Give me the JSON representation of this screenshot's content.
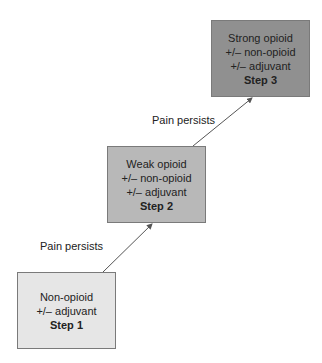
{
  "diagram": {
    "steps": [
      {
        "lines": [
          "Non-opioid",
          "+/– adjuvant"
        ],
        "step": "Step 1",
        "fill": "#e6e6e6"
      },
      {
        "lines": [
          "Weak opioid",
          "+/– non-opioid",
          "+/– adjuvant"
        ],
        "step": "Step 2",
        "fill": "#b8b8b8"
      },
      {
        "lines": [
          "Strong opioid",
          "+/– non-opioid",
          "+/– adjuvant"
        ],
        "step": "Step 3",
        "fill": "#909090"
      }
    ],
    "arrows": [
      {
        "label": "Pain persists",
        "from": "Step 1",
        "to": "Step 2"
      },
      {
        "label": "Pain persists",
        "from": "Step 2",
        "to": "Step 3"
      }
    ]
  }
}
